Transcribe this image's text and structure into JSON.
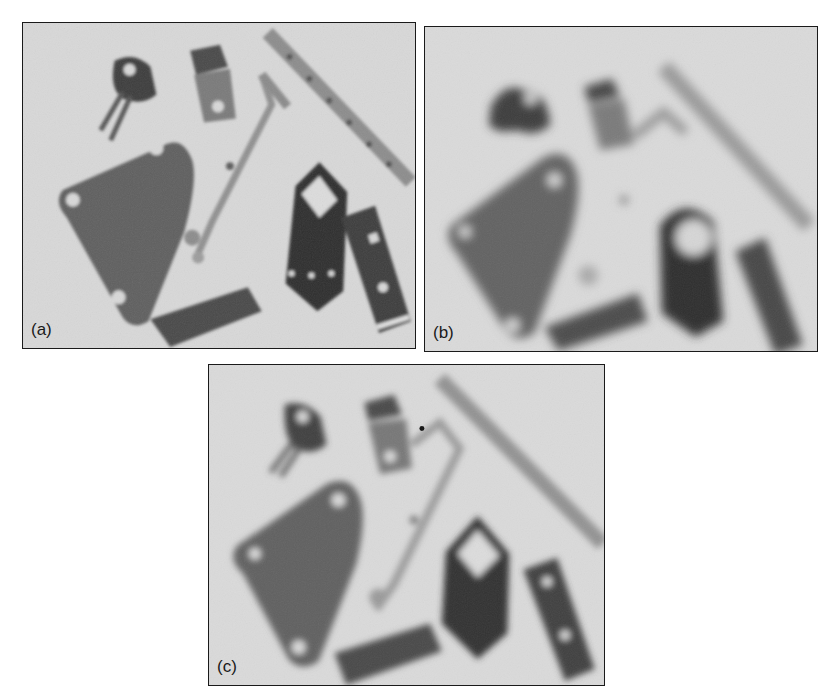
{
  "figure": {
    "panels": [
      {
        "id": "a",
        "label": "(a)",
        "description": "sharp image of metal parts"
      },
      {
        "id": "b",
        "label": "(b)",
        "description": "blurred image of metal parts"
      },
      {
        "id": "c",
        "label": "(c)",
        "description": "restored image of metal parts"
      }
    ]
  },
  "colors": {
    "background": "#d9d9d9",
    "part_dark": "#3a3a3a",
    "part_mid": "#6e6e6e",
    "frame": "#1a1a1a"
  }
}
